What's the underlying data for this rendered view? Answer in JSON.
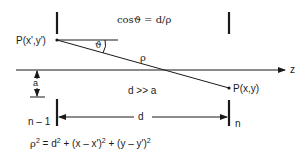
{
  "diagram": {
    "type": "geometry / wave propagation between planes",
    "labels": {
      "source_point": "P(x',y')",
      "field_point": "P(x,y)",
      "cos_relation": "cosϑ = d/ρ",
      "theta": "ϑ",
      "rho": "ρ",
      "axis": "z",
      "aperture": "a",
      "condition": "d >> a",
      "distance": "d",
      "plane_left": "n – 1",
      "plane_right": "n"
    },
    "formula": {
      "lhs": "ρ",
      "lhs_exp": "2",
      "eq": " = d",
      "d_exp": "2",
      "term2": " + (x – x')",
      "term2_exp": "2",
      "term3": " + (y – y')",
      "term3_exp": "2"
    },
    "colors": {
      "line": "#1a1a1a",
      "background": "#ffffff"
    }
  }
}
